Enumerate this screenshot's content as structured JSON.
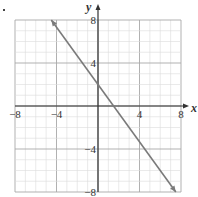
{
  "chart_data": {
    "type": "line",
    "title": "",
    "xlabel": "x",
    "ylabel": "y",
    "xlim": [
      -8,
      8
    ],
    "ylim": [
      -8,
      8
    ],
    "grid": true,
    "minor_grid_step": 1,
    "major_grid_step": 4,
    "x_ticks": [
      -8,
      -4,
      4,
      8
    ],
    "y_ticks": [
      8,
      4,
      -4,
      -8
    ],
    "x_tick_labels": [
      "−8",
      "−4",
      "4",
      "8"
    ],
    "y_tick_labels": [
      "8",
      "4",
      "−4",
      "−8"
    ],
    "series": [
      {
        "name": "line",
        "equation": "y = -4/3 x + 2",
        "slope": -1.3333,
        "y_intercept": 2,
        "x_intercept": 1.5,
        "x": [
          -4.5,
          7.5
        ],
        "y": [
          8,
          -8
        ],
        "arrows": "both",
        "color": "#7a7a7a"
      }
    ],
    "legend": null
  },
  "colors": {
    "minor_grid": "#dcdcdc",
    "major_grid": "#a8a8a8",
    "axis": "#333333",
    "line": "#7a7a7a"
  }
}
